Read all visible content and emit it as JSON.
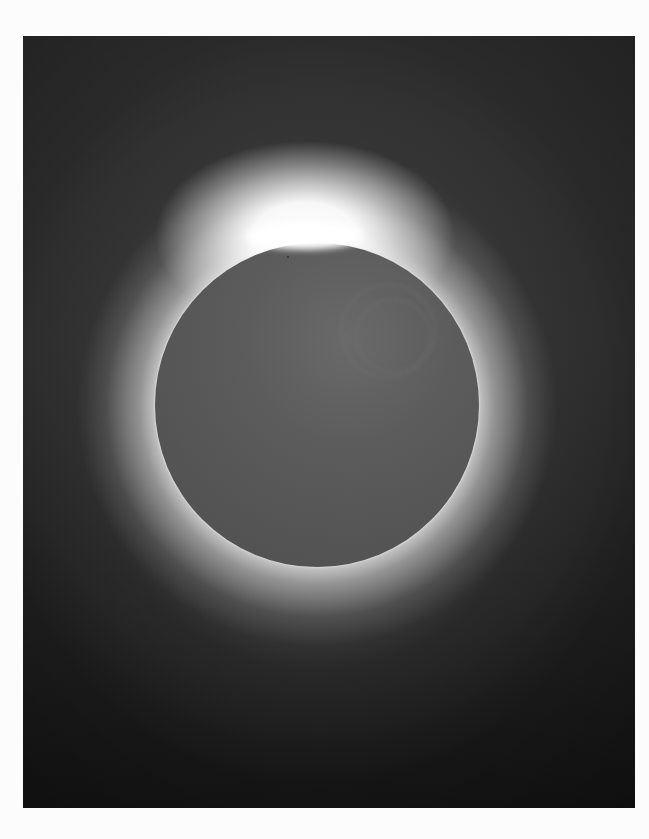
{
  "image": {
    "subject": "Total solar eclipse with diamond ring effect",
    "description": "Dark grey lunar disc surrounded by a bright white-grey corona, with an intense diamond-ring flare at the top edge of the disc, set on a dark grey background framed by a white page margin.",
    "colors": {
      "page_background": "#fcfcfc",
      "sky_background": "#2a2a2a",
      "moon_disc": "#575757",
      "corona": "#e8e8e8",
      "diamond_ring": "#ffffff"
    },
    "elements": {
      "photo_frame": {
        "x": 23,
        "y": 36,
        "width": 612,
        "height": 772
      },
      "moon": {
        "center_x": 317,
        "center_y": 405,
        "radius": 162
      },
      "diamond_ring_position": "top of lunar limb, slightly left of center"
    }
  }
}
